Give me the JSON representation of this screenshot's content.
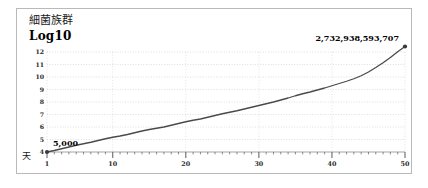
{
  "card": {
    "title": "細菌族群",
    "unit_label": "Log10",
    "x_axis_title": "天"
  },
  "chart_data": {
    "type": "line",
    "title": "細菌族群",
    "subtitle": "Log10",
    "xlabel": "天",
    "ylabel": "Log10",
    "grid": true,
    "legend": false,
    "xlim": [
      1,
      50
    ],
    "ylim": [
      4,
      12
    ],
    "y_ticks": [
      4,
      5,
      6,
      7,
      8,
      9,
      10,
      11,
      12
    ],
    "y_tick_labels": [
      "4",
      "5",
      "6",
      "7",
      "8",
      "9",
      "10",
      "11",
      "12"
    ],
    "x_ticks": [
      1,
      10,
      20,
      30,
      40,
      50
    ],
    "x_tick_labels": [
      "1",
      "10",
      "20",
      "30",
      "40",
      "50"
    ],
    "x_minor_tick_step": 1,
    "annotations": [
      {
        "name": "start-value",
        "text": "5,000",
        "x": 1,
        "y": 4.0
      },
      {
        "name": "end-value",
        "text": "2,732,938,593,707",
        "x": 50,
        "y": 12.44
      }
    ],
    "markers": [
      {
        "x": 1,
        "y": 4.0
      },
      {
        "x": 50,
        "y": 12.44
      }
    ],
    "series": [
      {
        "name": "bacterial-population-log10",
        "color": "#4a4a4a",
        "x": [
          1,
          2,
          3,
          4,
          5,
          6,
          7,
          8,
          9,
          10,
          11,
          12,
          13,
          14,
          15,
          16,
          17,
          18,
          19,
          20,
          21,
          22,
          23,
          24,
          25,
          26,
          27,
          28,
          29,
          30,
          31,
          32,
          33,
          34,
          35,
          36,
          37,
          38,
          39,
          40,
          41,
          42,
          43,
          44,
          45,
          46,
          47,
          48,
          49,
          50
        ],
        "values": [
          4.0,
          4.12,
          4.26,
          4.4,
          4.54,
          4.66,
          4.78,
          4.92,
          5.06,
          5.18,
          5.28,
          5.4,
          5.54,
          5.68,
          5.8,
          5.9,
          6.0,
          6.14,
          6.28,
          6.42,
          6.54,
          6.64,
          6.78,
          6.92,
          7.06,
          7.18,
          7.3,
          7.44,
          7.58,
          7.72,
          7.86,
          8.0,
          8.16,
          8.32,
          8.5,
          8.66,
          8.8,
          8.96,
          9.12,
          9.3,
          9.48,
          9.66,
          9.86,
          10.1,
          10.4,
          10.76,
          11.14,
          11.56,
          12.02,
          12.44
        ]
      }
    ]
  }
}
